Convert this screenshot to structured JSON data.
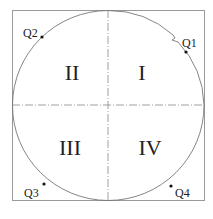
{
  "diagram": {
    "quadrants": [
      {
        "id": "I",
        "label": "I"
      },
      {
        "id": "II",
        "label": "II"
      },
      {
        "id": "III",
        "label": "III"
      },
      {
        "id": "IV",
        "label": "IV"
      }
    ],
    "points": [
      {
        "label": "Q1"
      },
      {
        "label": "Q2"
      },
      {
        "label": "Q3"
      },
      {
        "label": "Q4"
      }
    ],
    "colors": {
      "line": "#777777",
      "text": "#222222",
      "point": "#111111"
    }
  }
}
